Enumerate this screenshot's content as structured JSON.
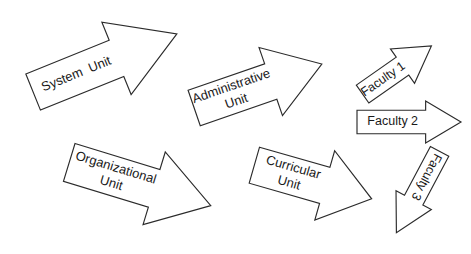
{
  "diagram": {
    "background_color": "#ffffff",
    "stroke_color": "#2b2b2b",
    "fill_color": "#ffffff",
    "arrows": [
      {
        "id": "system-unit",
        "label_line1": "System  Unit",
        "label_line2": "",
        "direction": "up-right",
        "rotation_deg": -22,
        "center_x": 105,
        "center_y": 63,
        "width": 155,
        "height": 78,
        "head_ratio": 0.42,
        "shaft_ratio": 0.5
      },
      {
        "id": "administrative-unit",
        "label_line1": "Administrative",
        "label_line2": "Unit",
        "direction": "up-right",
        "rotation_deg": -19,
        "center_x": 258,
        "center_y": 86,
        "width": 135,
        "height": 72,
        "head_ratio": 0.4,
        "shaft_ratio": 0.52
      },
      {
        "id": "organizational-unit",
        "label_line1": "Organizational",
        "label_line2": "Unit",
        "direction": "right-down",
        "rotation_deg": 17,
        "center_x": 140,
        "center_y": 184,
        "width": 148,
        "height": 76,
        "head_ratio": 0.4,
        "shaft_ratio": 0.52
      },
      {
        "id": "curricular-unit",
        "label_line1": "Curricular",
        "label_line2": "Unit",
        "direction": "right-down",
        "rotation_deg": 16,
        "center_x": 313,
        "center_y": 182,
        "width": 122,
        "height": 72,
        "head_ratio": 0.4,
        "shaft_ratio": 0.52
      },
      {
        "id": "faculty-1",
        "label_line1": "Faculty 1",
        "label_line2": "",
        "direction": "up-right",
        "rotation_deg": -35,
        "center_x": 397,
        "center_y": 70,
        "width": 84,
        "height": 42,
        "head_ratio": 0.42,
        "shaft_ratio": 0.52
      },
      {
        "id": "faculty-2",
        "label_line1": "Faculty 2",
        "label_line2": "",
        "direction": "right",
        "rotation_deg": 0,
        "center_x": 409,
        "center_y": 122,
        "width": 104,
        "height": 42,
        "head_ratio": 0.34,
        "shaft_ratio": 0.56
      },
      {
        "id": "faculty-3",
        "label_line1": "Faculty 3",
        "label_line2": "",
        "direction": "down-left",
        "rotation_deg": 118,
        "center_x": 418,
        "center_y": 192,
        "width": 92,
        "height": 40,
        "head_ratio": 0.4,
        "shaft_ratio": 0.52
      }
    ]
  }
}
